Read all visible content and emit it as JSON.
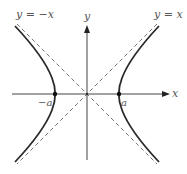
{
  "figure": {
    "axes": {
      "x_label": "x",
      "y_label": "y",
      "origin": [
        87,
        94
      ]
    },
    "asymptotes": [
      {
        "label": "y = −x",
        "style": "dashed"
      },
      {
        "label": "y = x",
        "style": "dashed"
      }
    ],
    "vertices": [
      {
        "label": "−a",
        "x": -1
      },
      {
        "label": "a",
        "x": 1
      }
    ],
    "colors": {
      "curve": "#2a2a2a",
      "axis": "#444444",
      "asymptote": "#666666",
      "label": "#555555"
    }
  }
}
